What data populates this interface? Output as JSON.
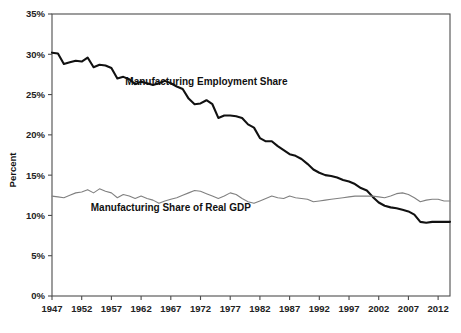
{
  "chart_data": {
    "type": "line",
    "title": "",
    "xlabel": "",
    "ylabel": "Percent",
    "xlim": [
      1947,
      2014
    ],
    "ylim": [
      0,
      35
    ],
    "grid": false,
    "legend_position": "inline-annotations",
    "y_tick_labels": [
      "0%",
      "5%",
      "10%",
      "15%",
      "20%",
      "25%",
      "30%",
      "35%"
    ],
    "y_ticks": [
      0,
      5,
      10,
      15,
      20,
      25,
      30,
      35
    ],
    "x_tick_labels": [
      "1947",
      "1952",
      "1957",
      "1962",
      "1967",
      "1972",
      "1977",
      "1982",
      "1987",
      "1992",
      "1997",
      "2002",
      "2007",
      "2012"
    ],
    "x_ticks": [
      1947,
      1952,
      1957,
      1962,
      1967,
      1972,
      1977,
      1982,
      1987,
      1992,
      1997,
      2002,
      2007,
      2012
    ],
    "x": [
      1947,
      1948,
      1949,
      1950,
      1951,
      1952,
      1953,
      1954,
      1955,
      1956,
      1957,
      1958,
      1959,
      1960,
      1961,
      1962,
      1963,
      1964,
      1965,
      1966,
      1967,
      1968,
      1969,
      1970,
      1971,
      1972,
      1973,
      1974,
      1975,
      1976,
      1977,
      1978,
      1979,
      1980,
      1981,
      1982,
      1983,
      1984,
      1985,
      1986,
      1987,
      1988,
      1989,
      1990,
      1991,
      1992,
      1993,
      1994,
      1995,
      1996,
      1997,
      1998,
      1999,
      2000,
      2001,
      2002,
      2003,
      2004,
      2005,
      2006,
      2007,
      2008,
      2009,
      2010,
      2011,
      2012,
      2013,
      2014
    ],
    "series": [
      {
        "name": "Manufacturing Employment Share",
        "color": "#111111",
        "width": 2.1,
        "label_x": 1973,
        "label_y": 26.2,
        "values": [
          30.2,
          30.1,
          28.8,
          29.0,
          29.2,
          29.1,
          29.6,
          28.4,
          28.7,
          28.6,
          28.3,
          27.0,
          27.2,
          26.9,
          26.3,
          26.6,
          26.4,
          26.2,
          26.4,
          26.7,
          26.4,
          26.0,
          25.7,
          24.5,
          23.8,
          23.9,
          24.3,
          23.8,
          22.1,
          22.4,
          22.4,
          22.3,
          22.1,
          21.3,
          20.9,
          19.6,
          19.2,
          19.2,
          18.6,
          18.1,
          17.6,
          17.4,
          17.0,
          16.4,
          15.7,
          15.3,
          15.0,
          14.9,
          14.7,
          14.4,
          14.2,
          13.9,
          13.4,
          13.1,
          12.3,
          11.6,
          11.2,
          11.0,
          10.9,
          10.7,
          10.5,
          10.1,
          9.2,
          9.1,
          9.2,
          9.2,
          9.2,
          9.2
        ]
      },
      {
        "name": "Manufacturing Share of Real GDP",
        "color": "#808080",
        "width": 1.1,
        "label_x": 1967,
        "label_y": 10.6,
        "values": [
          12.4,
          12.3,
          12.2,
          12.5,
          12.8,
          12.9,
          13.2,
          12.8,
          13.3,
          13.0,
          12.8,
          12.2,
          12.6,
          12.4,
          12.1,
          12.4,
          12.1,
          11.9,
          11.5,
          11.8,
          12.0,
          12.2,
          12.5,
          12.8,
          13.1,
          13.0,
          12.7,
          12.4,
          12.1,
          12.4,
          12.8,
          12.6,
          12.1,
          11.7,
          11.5,
          11.8,
          12.1,
          12.4,
          12.2,
          12.1,
          12.4,
          12.2,
          12.1,
          12.0,
          11.7,
          11.8,
          11.9,
          12.0,
          12.1,
          12.2,
          12.3,
          12.4,
          12.4,
          12.4,
          12.4,
          12.3,
          12.2,
          12.4,
          12.7,
          12.8,
          12.6,
          12.2,
          11.7,
          11.9,
          12.0,
          12.0,
          11.8,
          11.8
        ]
      }
    ]
  },
  "axes": {
    "y_axis_title": "Percent"
  }
}
